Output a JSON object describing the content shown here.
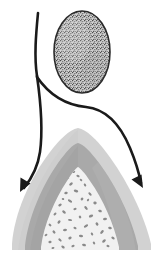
{
  "figure": {
    "title": "Stippled ovoid structure with two curved arrows pointing to a layered conical mound",
    "type": "grayscale-line-diagram",
    "width": 163,
    "height": 258,
    "background_color": "#ffffff"
  },
  "palette": {
    "ink": "#1a1a1a",
    "outline": "#2b2b2b",
    "ovoid_fill": "#cfcfcf",
    "ovoid_stipple": "#4a4a4a",
    "mound_outer": "#d2d2d2",
    "mound_middle": "#a9a9a9",
    "mound_inner_core": "#f1f1f1",
    "core_speckle": "#8a8a8a",
    "white": "#ffffff"
  },
  "elements": {
    "ovoid": {
      "label": "stippled ovoid body",
      "center_x": 82,
      "center_y": 52,
      "radius_x": 28,
      "radius_y": 41,
      "fill": "#cfcfcf",
      "stroke": "#2b2b2b",
      "stroke_width": 1.6,
      "texture": "fine-stipple",
      "stipple_count": 620
    },
    "arrow_stem": {
      "label": "shared arrow stem",
      "start_x": 38,
      "start_y": 13,
      "branch_x": 37,
      "branch_y": 78,
      "stroke": "#1a1a1a",
      "stroke_width": 2.6
    },
    "arrow_left": {
      "label": "left curved arrow",
      "tip_x": 20,
      "tip_y": 192,
      "direction": "down-left",
      "stroke": "#1a1a1a",
      "stroke_width": 2.6,
      "head_length": 15,
      "head_width": 11
    },
    "arrow_right": {
      "label": "right curved arrow",
      "tip_x": 143,
      "tip_y": 188,
      "direction": "down-right",
      "stroke": "#1a1a1a",
      "stroke_width": 2.6,
      "head_length": 15,
      "head_width": 11
    },
    "mound": {
      "label": "layered conical mound",
      "apex_x": 78,
      "apex_y": 128,
      "base_left_x": 12,
      "base_right_x": 151,
      "base_y": 248,
      "layers": [
        {
          "name": "outer-layer",
          "fill": "#d2d2d2"
        },
        {
          "name": "middle-layer",
          "fill": "#a9a9a9"
        },
        {
          "name": "inner-core",
          "fill": "#f1f1f1"
        }
      ],
      "core_speckle_count": 96,
      "core_speckle_fill": "#8a8a8a"
    }
  }
}
